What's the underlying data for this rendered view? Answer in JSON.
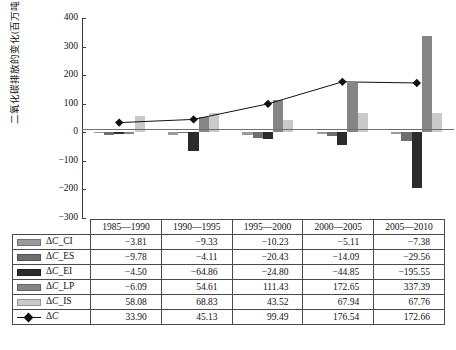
{
  "chart_data": {
    "type": "bar",
    "title": "",
    "xlabel": "",
    "ylabel": "二氧化碳排放的变化(百万吨)",
    "ylim": [
      -300,
      400
    ],
    "ytick_step": 100,
    "yticks": [
      "400",
      "300",
      "200",
      "100",
      "0",
      "−100",
      "−200",
      "−300"
    ],
    "grid": false,
    "legend_position": "table-left-column",
    "categories": [
      "1985—1990",
      "1990—1995",
      "1995—2000",
      "2000—2005",
      "2005—2010"
    ],
    "series": [
      {
        "name": "ΔC_CI",
        "type": "bar",
        "color": "#9a9a9a",
        "values": [
          -3.81,
          -9.33,
          -10.23,
          -5.11,
          -7.38
        ]
      },
      {
        "name": "ΔC_ES",
        "type": "bar",
        "color": "#6e6e6e",
        "values": [
          -9.78,
          -4.11,
          -20.43,
          -14.09,
          -29.56
        ]
      },
      {
        "name": "ΔC_EI",
        "type": "bar",
        "color": "#2b2b2b",
        "values": [
          -4.5,
          -64.86,
          -24.8,
          -44.85,
          -195.55
        ]
      },
      {
        "name": "ΔC_LP",
        "type": "bar",
        "color": "#858585",
        "values": [
          -6.09,
          54.61,
          111.43,
          172.65,
          337.39
        ]
      },
      {
        "name": "ΔC_IS",
        "type": "bar",
        "color": "#c9c9c9",
        "values": [
          58.08,
          68.83,
          43.52,
          67.94,
          67.76
        ]
      },
      {
        "name": "ΔC",
        "type": "line",
        "color": "#111111",
        "marker": "diamond",
        "values": [
          33.9,
          45.13,
          99.49,
          176.54,
          172.66
        ]
      }
    ]
  },
  "table": {
    "corner": "",
    "headers": [
      "1985—1990",
      "1990—1995",
      "1995—2000",
      "2000—2005",
      "2005—2010"
    ],
    "rows": [
      {
        "label_prefix": "Δ",
        "label_italic": "C",
        "label_suffix": "_CI",
        "swatch": "#9a9a9a",
        "swatch_kind": "bar",
        "values": [
          "−3.81",
          "−9.33",
          "−10.23",
          "−5.11",
          "−7.38"
        ]
      },
      {
        "label_prefix": "Δ",
        "label_italic": "C",
        "label_suffix": "_ES",
        "swatch": "#6e6e6e",
        "swatch_kind": "bar",
        "values": [
          "−9.78",
          "−4.11",
          "−20.43",
          "−14.09",
          "−29.56"
        ]
      },
      {
        "label_prefix": "Δ",
        "label_italic": "C",
        "label_suffix": "_EI",
        "swatch": "#2b2b2b",
        "swatch_kind": "bar",
        "values": [
          "−4.50",
          "−64.86",
          "−24.80",
          "−44.85",
          "−195.55"
        ]
      },
      {
        "label_prefix": "Δ",
        "label_italic": "C",
        "label_suffix": "_LP",
        "swatch": "#858585",
        "swatch_kind": "bar",
        "values": [
          "−6.09",
          "54.61",
          "111.43",
          "172.65",
          "337.39"
        ]
      },
      {
        "label_prefix": "Δ",
        "label_italic": "C",
        "label_suffix": "_IS",
        "swatch": "#c9c9c9",
        "swatch_kind": "bar",
        "values": [
          "58.08",
          "68.83",
          "43.52",
          "67.94",
          "67.76"
        ]
      },
      {
        "label_prefix": "Δ",
        "label_italic": "C",
        "label_suffix": "",
        "swatch": "#111111",
        "swatch_kind": "line",
        "values": [
          "33.90",
          "45.13",
          "99.49",
          "176.54",
          "172.66"
        ]
      }
    ]
  }
}
